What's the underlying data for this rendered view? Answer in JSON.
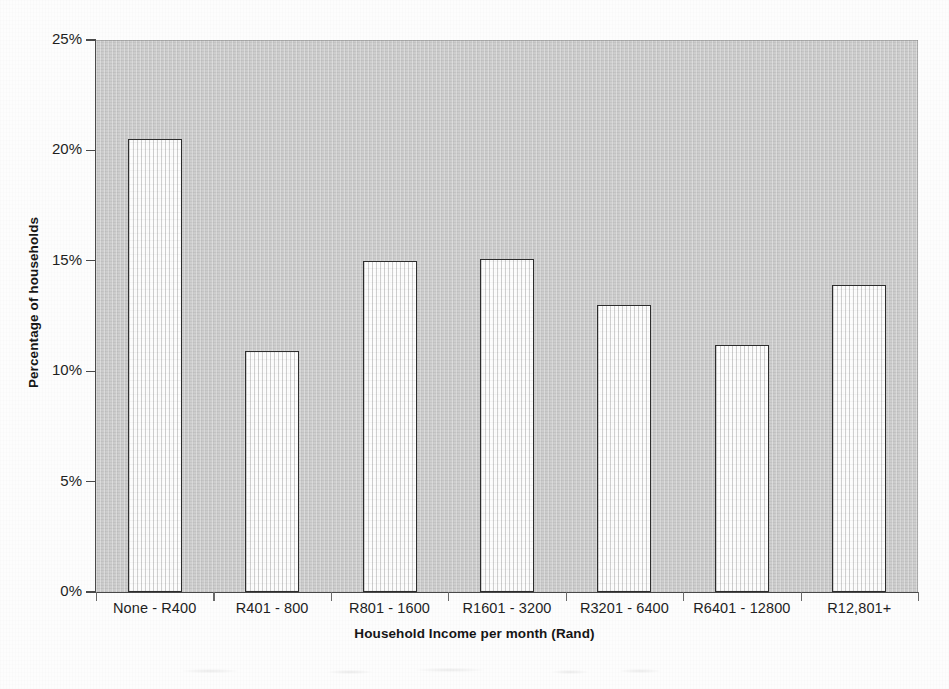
{
  "chart_data": {
    "type": "bar",
    "title": "",
    "subtitle": "",
    "xlabel": "Household Income per month (Rand)",
    "ylabel": "Percentage of households",
    "categories": [
      "None - R400",
      "R401 - 800",
      "R801 - 1600",
      "R1601 - 3200",
      "R3201 - 6400",
      "R6401 - 12800",
      "R12,801+"
    ],
    "values": [
      20.5,
      10.9,
      15.0,
      15.1,
      13.0,
      11.2,
      13.9
    ],
    "value_unit": "%",
    "ylim": [
      0,
      25
    ],
    "ytick_values": [
      0,
      5,
      10,
      15,
      20,
      25
    ],
    "ytick_labels": [
      "0%",
      "5%",
      "10%",
      "15%",
      "20%",
      "25%"
    ],
    "grid": false,
    "legend": null,
    "legend_position": "none",
    "annotations": [],
    "colors": {
      "plot_background": "#c9c9c9",
      "bar_fill": "#fdfdfd",
      "bar_border": "#2d2d2d",
      "axis": "#4a4a4a",
      "text": "#1f1f1f",
      "page_background": "#fdfdfd"
    }
  },
  "axes": {
    "y_title": "Percentage of households",
    "x_title": "Household Income per month (Rand)"
  }
}
